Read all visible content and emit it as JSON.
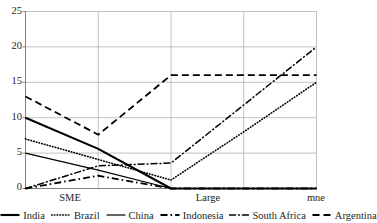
{
  "chart_data": {
    "type": "line",
    "title": "",
    "xlabel": "",
    "ylabel": "",
    "categories": [
      "SME",
      "",
      "Large",
      "",
      "mne"
    ],
    "tick_labels_x": [
      "SME",
      "Large",
      "mne"
    ],
    "tick_labels_y": [
      "0",
      "5",
      "10",
      "15",
      "20",
      "25"
    ],
    "ylim": [
      0,
      25
    ],
    "grid": true,
    "legend_position": "bottom",
    "series": [
      {
        "name": "India",
        "style": "solid-thick",
        "values": [
          10,
          5.6,
          0,
          0,
          0
        ]
      },
      {
        "name": "Brazil",
        "style": "dotted",
        "values": [
          7,
          4.1,
          1.2,
          8,
          15
        ]
      },
      {
        "name": "China",
        "style": "solid-thin",
        "values": [
          5,
          2.6,
          0,
          0,
          0
        ]
      },
      {
        "name": "Indonesia",
        "style": "dash-dot",
        "values": [
          0,
          1.8,
          0,
          0,
          0
        ]
      },
      {
        "name": "South Africa",
        "style": "dash-dot-long",
        "values": [
          0,
          3.2,
          3.6,
          11.8,
          20
        ]
      },
      {
        "name": "Argentina",
        "style": "dashed",
        "values": [
          13,
          7.6,
          16,
          16,
          16
        ]
      }
    ]
  },
  "axis": {
    "y_ticks": [
      0,
      5,
      10,
      15,
      20,
      25
    ],
    "x_ticks": [
      "SME",
      "Large",
      "mne"
    ]
  },
  "legend": {
    "items": [
      {
        "label": "India"
      },
      {
        "label": "Brazil"
      },
      {
        "label": "China"
      },
      {
        "label": "Indonesia"
      },
      {
        "label": "South Africa"
      },
      {
        "label": "Argentina"
      }
    ]
  },
  "colors": {
    "line": "#000000",
    "grid": "#b3b3b3",
    "axis": "#808080",
    "text": "#231f20",
    "background": "#ffffff"
  }
}
